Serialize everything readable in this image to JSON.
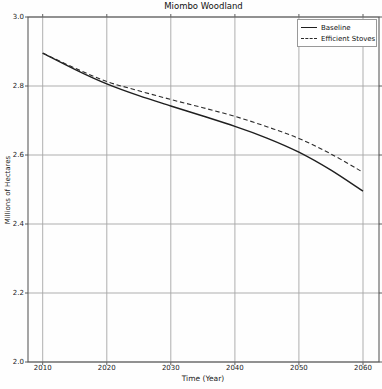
{
  "chart_data": {
    "type": "line",
    "title": "Miombo Woodland",
    "xlabel": "Time (Year)",
    "ylabel": "Millions of Hectares",
    "xlim": [
      2007.7,
      2062.5
    ],
    "ylim": [
      2.0,
      3.0
    ],
    "xticks": [
      2010,
      2020,
      2030,
      2040,
      2050,
      2060
    ],
    "xtick_labels": [
      "2010",
      "2020",
      "2030",
      "2040",
      "2050",
      "2060"
    ],
    "yticks": [
      2.0,
      2.2,
      2.4,
      2.6,
      2.8,
      3.0
    ],
    "ytick_labels": [
      "2.0",
      "2.2",
      "2.4",
      "2.6",
      "2.8",
      "3.0"
    ],
    "grid": true,
    "legend_position": "upper right",
    "x": [
      2010,
      2015,
      2020,
      2025,
      2030,
      2035,
      2040,
      2045,
      2050,
      2055,
      2060
    ],
    "series": [
      {
        "name": "Baseline",
        "style": "solid",
        "color": "#1f1f1f",
        "values": [
          2.895,
          2.848,
          2.806,
          2.772,
          2.742,
          2.713,
          2.683,
          2.649,
          2.608,
          2.556,
          2.495
        ]
      },
      {
        "name": "Efficient Stoves",
        "style": "dashed",
        "color": "#2b2b2b",
        "values": [
          2.895,
          2.852,
          2.813,
          2.786,
          2.761,
          2.737,
          2.712,
          2.682,
          2.648,
          2.603,
          2.55
        ]
      }
    ],
    "colors": {
      "grid": "#a6a6a6",
      "frame": "#4d4d4d",
      "text": "#1a1a1a",
      "background": "#fefefe"
    }
  }
}
